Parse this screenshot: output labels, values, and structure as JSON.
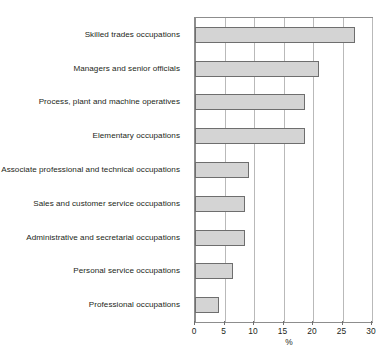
{
  "chart_data": {
    "type": "bar",
    "orientation": "horizontal",
    "title": "",
    "xlabel": "%",
    "ylabel": "",
    "xlim": [
      0,
      30
    ],
    "xticks": [
      0,
      5,
      10,
      15,
      20,
      25,
      30
    ],
    "xtick_labels": [
      "0",
      "5",
      "10",
      "15",
      "20",
      "25",
      "30"
    ],
    "grid": true,
    "grid_axis": "x",
    "legend": false,
    "bar_fill_color": "#d4d4d4",
    "bar_border_color": "#6e6e6e",
    "categories": [
      "Skilled trades occupations",
      "Managers and senior officials",
      "Process, plant and machine operatives",
      "Elementary occupations",
      "Associate professional and technical occupations",
      "Sales and customer service occupations",
      "Administrative and secretarial occupations",
      "Personal service occupations",
      "Professional occupations"
    ],
    "values": [
      27.2,
      21.0,
      18.6,
      18.6,
      9.2,
      8.5,
      8.5,
      6.4,
      4.0
    ]
  }
}
